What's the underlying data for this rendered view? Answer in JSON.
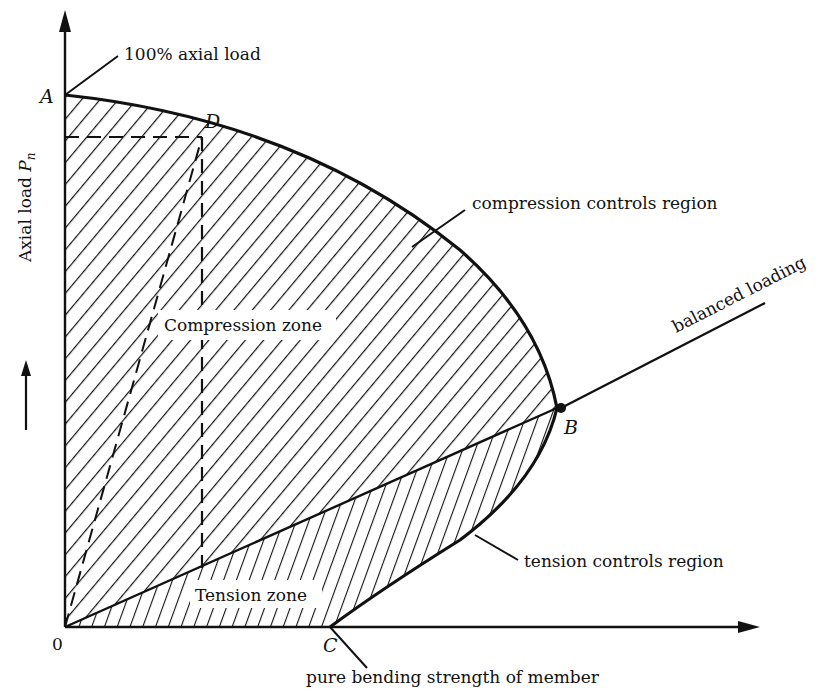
{
  "diagram": {
    "type": "interaction-diagram",
    "colors": {
      "ink": "#111111",
      "background": "#ffffff"
    },
    "axes": {
      "y_label": "Axial load",
      "y_label_symbol": "P",
      "y_label_subscript": "n",
      "origin_label": "0"
    },
    "points": {
      "A": "A",
      "B": "B",
      "C": "C",
      "D": "D"
    },
    "annotations": {
      "axial_load_100": "100% axial load",
      "compression_controls": "compression controls region",
      "balanced_loading": "balanced loading",
      "tension_controls": "tension controls region",
      "pure_bending": "pure bending strength of member"
    },
    "zones": {
      "compression": "Compression zone",
      "tension": "Tension zone"
    }
  }
}
